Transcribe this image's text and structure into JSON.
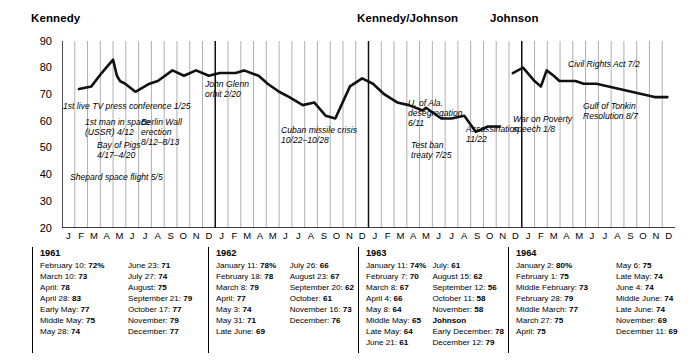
{
  "sections": [
    {
      "id": "kennedy",
      "label": "Kennedy"
    },
    {
      "id": "kennedy-johnson",
      "label": "Kennedy/Johnson"
    },
    {
      "id": "johnson",
      "label": "Johnson"
    }
  ],
  "axis": {
    "y_ticks": [
      "90",
      "80",
      "70",
      "60",
      "50",
      "40",
      "30",
      "20"
    ],
    "month_letters": [
      "J",
      "F",
      "M",
      "A",
      "M",
      "J",
      "J",
      "A",
      "S",
      "O",
      "N",
      "D"
    ],
    "years": [
      "1961",
      "1962",
      "1963",
      "1964"
    ]
  },
  "annotations": [
    {
      "name": "first-tv-press-conference",
      "text": "1st live TV press conference 1/25"
    },
    {
      "name": "first-man-in-space",
      "text": "1st man in space\n(USSR) 4/12"
    },
    {
      "name": "bay-of-pigs",
      "text": "Bay of Pigs\n4/17–4/20"
    },
    {
      "name": "shepard-space-flight",
      "text": "Shepard space flight 5/5"
    },
    {
      "name": "berlin-wall",
      "text": "Berlin Wall\nerection\n8/12–8/13"
    },
    {
      "name": "john-glenn-orbit",
      "text": "John Glenn\norbit 2/20"
    },
    {
      "name": "cuban-missile-crisis",
      "text": "Cuban missile crisis\n10/22–10/28"
    },
    {
      "name": "u-of-ala-desegregation",
      "text": "U. of Ala.\ndesegregation\n6/11"
    },
    {
      "name": "test-ban-treaty",
      "text": "Test ban\ntreaty 7/25"
    },
    {
      "name": "assassination",
      "text": "Assassination\n11/22"
    },
    {
      "name": "war-on-poverty",
      "text": "War on Poverty\nspeech 1/8"
    },
    {
      "name": "civil-rights-act",
      "text": "Civil Rights Act 7/2"
    },
    {
      "name": "gulf-of-tonkin",
      "text": "Gulf of Tonkin\nResolution 8/7"
    }
  ],
  "tables": [
    {
      "year": "1961",
      "left": [
        [
          "February 10:",
          "72%"
        ],
        [
          "March 10:",
          "73"
        ],
        [
          "April:",
          "78"
        ],
        [
          "April 28:",
          "83"
        ],
        [
          "Early May:",
          "77"
        ],
        [
          "Middle May:",
          "75"
        ],
        [
          "May 28:",
          "74"
        ]
      ],
      "right": [
        [
          "June 23:",
          "71"
        ],
        [
          "July 27:",
          "74"
        ],
        [
          "August:",
          "75"
        ],
        [
          "September 21:",
          "79"
        ],
        [
          "October 17:",
          "77"
        ],
        [
          "November:",
          "79"
        ],
        [
          "December:",
          "77"
        ]
      ]
    },
    {
      "year": "1962",
      "left": [
        [
          "January 11:",
          "78%"
        ],
        [
          "February 18:",
          "78"
        ],
        [
          "March 8:",
          "79"
        ],
        [
          "April:",
          "77"
        ],
        [
          "May 3:",
          "74"
        ],
        [
          "May 31:",
          "71"
        ],
        [
          "Late June:",
          "69"
        ]
      ],
      "right": [
        [
          "July 26:",
          "66"
        ],
        [
          "August 23:",
          "67"
        ],
        [
          "September 20:",
          "62"
        ],
        [
          "October:",
          "61"
        ],
        [
          "November 16:",
          "73"
        ],
        [
          "December:",
          "76"
        ]
      ]
    },
    {
      "year": "1963",
      "left": [
        [
          "January 11:",
          "74%"
        ],
        [
          "February 7:",
          "70"
        ],
        [
          "March 8:",
          "67"
        ],
        [
          "April 4:",
          "66"
        ],
        [
          "May 8:",
          "64"
        ],
        [
          "Middle May:",
          "65"
        ],
        [
          "Late May:",
          "64"
        ],
        [
          "June 21:",
          "61"
        ]
      ],
      "right": [
        [
          "July:",
          "61"
        ],
        [
          "August 15:",
          "62"
        ],
        [
          "September 12:",
          "56"
        ],
        [
          "October 11:",
          "58"
        ],
        [
          "November:",
          "58"
        ]
      ],
      "subhead": "Johnson",
      "right_after": [
        [
          "Early December:",
          "78"
        ],
        [
          "December 12:",
          "79"
        ]
      ]
    },
    {
      "year": "1964",
      "left": [
        [
          "January 2:",
          "80%"
        ],
        [
          "February 1:",
          "75"
        ],
        [
          "Middle February:",
          "73"
        ],
        [
          "February 28:",
          "79"
        ],
        [
          "Middle March:",
          "77"
        ],
        [
          "March 27:",
          "75"
        ],
        [
          "April:",
          "75"
        ]
      ],
      "right": [
        [
          "May 6:",
          "75"
        ],
        [
          "Late May:",
          "74"
        ],
        [
          "June 4:",
          "74"
        ],
        [
          "Middle June:",
          "74"
        ],
        [
          "Late June:",
          "74"
        ],
        [
          "November:",
          "69"
        ],
        [
          "December 11:",
          "69"
        ]
      ]
    }
  ],
  "chart_data": {
    "type": "line",
    "xlabel": "",
    "ylabel": "",
    "ylim": [
      20,
      90
    ],
    "grid": true,
    "legend": "none",
    "x_categories": [
      "1961-J",
      "1961-F",
      "1961-M",
      "1961-A",
      "1961-M",
      "1961-J",
      "1961-J",
      "1961-A",
      "1961-S",
      "1961-O",
      "1961-N",
      "1961-D",
      "1962-J",
      "1962-F",
      "1962-M",
      "1962-A",
      "1962-M",
      "1962-J",
      "1962-J",
      "1962-A",
      "1962-S",
      "1962-O",
      "1962-N",
      "1962-D",
      "1963-J",
      "1963-F",
      "1963-M",
      "1963-A",
      "1963-M",
      "1963-J",
      "1963-J",
      "1963-A",
      "1963-S",
      "1963-O",
      "1963-N",
      "1963-D",
      "1964-J",
      "1964-F",
      "1964-M",
      "1964-A",
      "1964-M",
      "1964-J",
      "1964-J",
      "1964-A",
      "1964-S",
      "1964-O",
      "1964-N",
      "1964-D"
    ],
    "series": [
      {
        "name": "Approval rating (%)",
        "points": [
          {
            "label": "February 10, 1961",
            "x": 1.33,
            "y": 72
          },
          {
            "label": "March 10, 1961",
            "x": 2.3,
            "y": 73
          },
          {
            "label": "April 1961",
            "x": 3.1,
            "y": 78
          },
          {
            "label": "April 28, 1961",
            "x": 4.0,
            "y": 83
          },
          {
            "label": "Early May 1961",
            "x": 4.3,
            "y": 77
          },
          {
            "label": "Middle May 1961",
            "x": 4.55,
            "y": 75
          },
          {
            "label": "May 28, 1961",
            "x": 4.95,
            "y": 74
          },
          {
            "label": "June 23, 1961",
            "x": 5.75,
            "y": 71
          },
          {
            "label": "July 27, 1961",
            "x": 6.85,
            "y": 74
          },
          {
            "label": "August 1961",
            "x": 7.5,
            "y": 75
          },
          {
            "label": "September 21, 1961",
            "x": 8.65,
            "y": 79
          },
          {
            "label": "October 17, 1961",
            "x": 9.55,
            "y": 77
          },
          {
            "label": "November 1961",
            "x": 10.5,
            "y": 79
          },
          {
            "label": "December 1961",
            "x": 11.5,
            "y": 77
          },
          {
            "label": "January 11, 1962",
            "x": 12.35,
            "y": 78
          },
          {
            "label": "February 18, 1962",
            "x": 13.6,
            "y": 78
          },
          {
            "label": "March 8, 1962",
            "x": 14.25,
            "y": 79
          },
          {
            "label": "April 1962",
            "x": 15.4,
            "y": 77
          },
          {
            "label": "May 3, 1962",
            "x": 16.1,
            "y": 74
          },
          {
            "label": "May 31, 1962",
            "x": 17.0,
            "y": 71
          },
          {
            "label": "Late June 1962",
            "x": 17.8,
            "y": 69
          },
          {
            "label": "July 26, 1962",
            "x": 18.85,
            "y": 66
          },
          {
            "label": "August 23, 1962",
            "x": 19.75,
            "y": 67
          },
          {
            "label": "September 20, 1962",
            "x": 20.65,
            "y": 62
          },
          {
            "label": "October 1962",
            "x": 21.4,
            "y": 61
          },
          {
            "label": "November 16, 1962",
            "x": 22.55,
            "y": 73
          },
          {
            "label": "December 1962",
            "x": 23.5,
            "y": 76
          },
          {
            "label": "January 11, 1963",
            "x": 24.35,
            "y": 74
          },
          {
            "label": "February 7, 1963",
            "x": 25.25,
            "y": 70
          },
          {
            "label": "March 8, 1963",
            "x": 26.25,
            "y": 67
          },
          {
            "label": "April 4, 1963",
            "x": 27.15,
            "y": 66
          },
          {
            "label": "May 8, 1963",
            "x": 28.25,
            "y": 64
          },
          {
            "label": "Middle May 1963",
            "x": 28.5,
            "y": 65
          },
          {
            "label": "Late May 1963",
            "x": 28.8,
            "y": 64
          },
          {
            "label": "June 21, 1963",
            "x": 29.7,
            "y": 61
          },
          {
            "label": "July 1963",
            "x": 30.5,
            "y": 61
          },
          {
            "label": "August 15, 1963",
            "x": 31.5,
            "y": 62
          },
          {
            "label": "September 12, 1963",
            "x": 32.4,
            "y": 56
          },
          {
            "label": "October 11, 1963",
            "x": 33.35,
            "y": 58
          },
          {
            "label": "November 1963",
            "x": 34.3,
            "y": 58
          },
          {
            "label": "Early December 1963 (Johnson)",
            "x": 35.3,
            "y": 78
          },
          {
            "label": "December 12, 1963",
            "x": 35.7,
            "y": 79
          },
          {
            "label": "January 2, 1964",
            "x": 36.1,
            "y": 80
          },
          {
            "label": "February 1, 1964",
            "x": 37.0,
            "y": 75
          },
          {
            "label": "Middle February 1964",
            "x": 37.5,
            "y": 73
          },
          {
            "label": "February 28, 1964",
            "x": 37.95,
            "y": 79
          },
          {
            "label": "Middle March 1964",
            "x": 38.5,
            "y": 77
          },
          {
            "label": "March 27, 1964",
            "x": 38.95,
            "y": 75
          },
          {
            "label": "April 1964",
            "x": 39.5,
            "y": 75
          },
          {
            "label": "May 6, 1964",
            "x": 40.2,
            "y": 75
          },
          {
            "label": "Late May 1964",
            "x": 40.85,
            "y": 74
          },
          {
            "label": "June 4, 1964",
            "x": 41.15,
            "y": 74
          },
          {
            "label": "Middle June 1964",
            "x": 41.5,
            "y": 74
          },
          {
            "label": "Late June 1964",
            "x": 41.85,
            "y": 74
          },
          {
            "label": "November 1964",
            "x": 46.4,
            "y": 69
          },
          {
            "label": "December 11, 1964",
            "x": 47.4,
            "y": 69
          }
        ]
      }
    ]
  }
}
